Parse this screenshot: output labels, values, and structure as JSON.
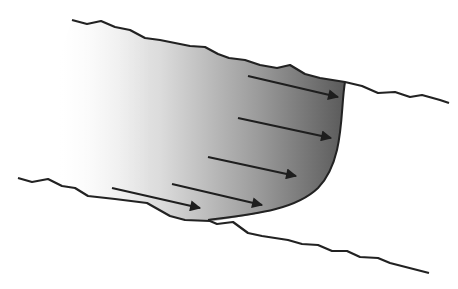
{
  "diagram": {
    "title": "",
    "colors": {
      "line": "#222222",
      "fluid_light": "#ffffff",
      "fluid_dark": "#555555"
    },
    "elements": {
      "top_wall": "upper boundary wall",
      "bottom_wall": "lower boundary wall",
      "fluid_body": "shaded flow region",
      "velocity_front": "velocity profile front",
      "arrows": [
        {
          "name": "velocity-arrow-1"
        },
        {
          "name": "velocity-arrow-2"
        },
        {
          "name": "velocity-arrow-3"
        },
        {
          "name": "velocity-arrow-4"
        },
        {
          "name": "velocity-arrow-5"
        }
      ]
    }
  }
}
